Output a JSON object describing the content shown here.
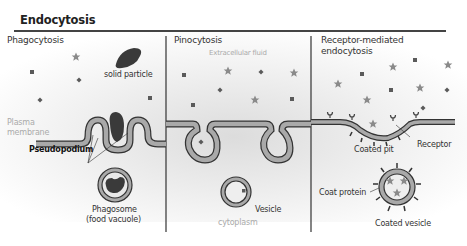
{
  "title": "Endocytosis",
  "panels": [
    {
      "heading": "Phagocytosis",
      "labels": {
        "solid_particle": "solid particle",
        "plasma_membrane_line1": "Plasma",
        "plasma_membrane_line2": "membrane",
        "pseudopodium": "Pseudopodium",
        "phagosome_line1": "Phagosome",
        "phagosome_line2": "(food vacuole)"
      }
    },
    {
      "heading": "Pinocytosis",
      "labels": {
        "extracellular_fluid": "Extracellular fluid",
        "vesicle": "Vesicle",
        "cytoplasm": "cytoplasm"
      }
    },
    {
      "heading_line1": "Receptor-mediated",
      "heading_line2": "endocytosis",
      "labels": {
        "coated_pit": "Coated pit",
        "receptor": "Receptor",
        "coat_protein": "Coat protein",
        "coated_vesicle": "Coated vesicle"
      }
    }
  ],
  "colors": {
    "membrane_fill": "#a9a9a9",
    "membrane_outline": "#333333",
    "particle": "#3a3a3a",
    "star": "#8a8a8a",
    "square": "#5a5a5a"
  }
}
